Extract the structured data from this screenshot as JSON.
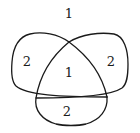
{
  "diagram": {
    "type": "three-curve-region-diagram",
    "stroke_color": "#1a1a1a",
    "background_color": "#ffffff",
    "regions": [
      {
        "id": "outer-top",
        "label": "1"
      },
      {
        "id": "left-lobe",
        "label": "2"
      },
      {
        "id": "center",
        "label": "1"
      },
      {
        "id": "right-lobe",
        "label": "2"
      },
      {
        "id": "bottom-lobe",
        "label": "2"
      }
    ]
  }
}
